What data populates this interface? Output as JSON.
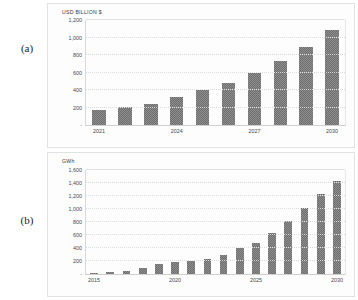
{
  "figure": {
    "panels": [
      {
        "tag": "(a)",
        "axis_title": "USD BILLION $"
      },
      {
        "tag": "(b)",
        "axis_title": "GWh"
      }
    ]
  },
  "chart_data": [
    {
      "type": "bar",
      "title": "",
      "ylabel": "USD BILLION $",
      "xlabel": "",
      "ylim": [
        0,
        1200
      ],
      "yticks": [
        "200",
        "400",
        "600",
        "800",
        "1,000",
        "1,200"
      ],
      "ytick_values": [
        200,
        400,
        600,
        800,
        1000,
        1200
      ],
      "zero_tick": "-",
      "grid": true,
      "legend": "none",
      "categories": [
        "2021",
        "2022",
        "2023",
        "2024",
        "2025",
        "2026",
        "2027",
        "2028",
        "2029",
        "2030"
      ],
      "xtick_labels": [
        "2021",
        "2024",
        "2027",
        "2030"
      ],
      "xtick_indices": [
        0,
        3,
        6,
        9
      ],
      "values": [
        170,
        205,
        245,
        320,
        400,
        480,
        595,
        730,
        890,
        1090
      ]
    },
    {
      "type": "bar",
      "title": "",
      "ylabel": "GWh",
      "xlabel": "",
      "ylim": [
        0,
        1600
      ],
      "yticks": [
        "200",
        "400",
        "600",
        "800",
        "1,000",
        "1,200",
        "1,400",
        "1,600"
      ],
      "ytick_values": [
        200,
        400,
        600,
        800,
        1000,
        1200,
        1400,
        1600
      ],
      "zero_tick": "-",
      "grid": true,
      "legend": "none",
      "categories": [
        "2015",
        "2016",
        "2017",
        "2018",
        "2019",
        "2020",
        "2021",
        "2022",
        "2023",
        "2024",
        "2025",
        "2026",
        "2027",
        "2028",
        "2029",
        "2030"
      ],
      "xtick_labels": [
        "2015",
        "2020",
        "2025",
        "2030"
      ],
      "xtick_indices": [
        0,
        5,
        10,
        15
      ],
      "values": [
        15,
        30,
        45,
        85,
        160,
        190,
        195,
        230,
        300,
        400,
        480,
        630,
        810,
        1010,
        1230,
        1430
      ]
    }
  ]
}
